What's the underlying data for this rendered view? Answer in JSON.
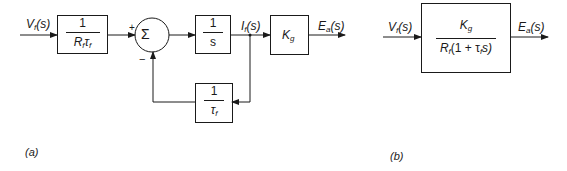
{
  "panel_a": {
    "label": "(a)",
    "input_signal": {
      "main": "V",
      "sub": "f",
      "arg": "(s)"
    },
    "block1": {
      "numerator": "1",
      "den_main1": "R",
      "den_sub1": "f",
      "den_main2": "τ",
      "den_sub2": "f"
    },
    "summer": {
      "symbol": "Σ",
      "plus": "+",
      "minus": "−"
    },
    "block2": {
      "numerator": "1",
      "denominator": "s"
    },
    "intermediate_signal": {
      "main": "I",
      "sub": "f",
      "arg": "(s)"
    },
    "block3": {
      "main": "K",
      "sub": "g"
    },
    "output_signal": {
      "main": "E",
      "sub": "a",
      "arg": "(s)"
    },
    "feedback_block": {
      "numerator": "1",
      "den_main": "τ",
      "den_sub": "f"
    }
  },
  "panel_b": {
    "label": "(b)",
    "input_signal": {
      "main": "V",
      "sub": "f",
      "arg": "(s)"
    },
    "block": {
      "num_main": "K",
      "num_sub": "g",
      "den_main": "R",
      "den_sub": "f",
      "den_mid": "(1 + τ",
      "den_sub2": "f",
      "den_end": "s)"
    },
    "output_signal": {
      "main": "E",
      "sub": "a",
      "arg": "(s)"
    }
  },
  "colors": {
    "ink": "#1a1a1a",
    "background": "#ffffff"
  }
}
